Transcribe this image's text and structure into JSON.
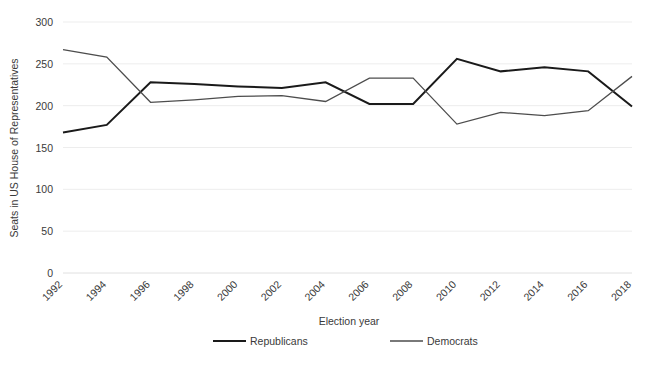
{
  "chart_data": {
    "type": "line",
    "title": "",
    "xlabel": "Election year",
    "ylabel": "Seats in US House of Representatives",
    "x": [
      1992,
      1994,
      1996,
      1998,
      2000,
      2002,
      2004,
      2006,
      2008,
      2010,
      2012,
      2014,
      2016,
      2018
    ],
    "xtick_labels": [
      "1992",
      "1994",
      "1996",
      "1998",
      "2000",
      "2002",
      "2004",
      "2006",
      "2008",
      "2010",
      "2012",
      "2014",
      "2016",
      "2018"
    ],
    "ytick_labels": [
      "0",
      "50",
      "100",
      "150",
      "200",
      "250",
      "300"
    ],
    "yticks": [
      0,
      50,
      100,
      150,
      200,
      250,
      300
    ],
    "ylim": [
      0,
      300
    ],
    "grid": "horizontal",
    "legend_position": "bottom",
    "series": [
      {
        "name": "Republicans",
        "color": "#1a1a1a",
        "width": 2.0,
        "values": [
          168,
          177,
          228,
          226,
          223,
          221,
          228,
          202,
          202,
          256,
          241,
          246,
          241,
          199
        ]
      },
      {
        "name": "Democrats",
        "color": "#4d4d4d",
        "width": 1.3,
        "values": [
          267,
          258,
          204,
          207,
          211,
          212,
          205,
          233,
          233,
          178,
          192,
          188,
          194,
          235
        ]
      }
    ]
  },
  "legend": {
    "items": [
      {
        "label": "Republicans"
      },
      {
        "label": "Democrats"
      }
    ]
  },
  "axes": {
    "x_title": "Election year",
    "y_title": "Seats in US House of Representatives"
  },
  "caption": {
    "text": ""
  }
}
